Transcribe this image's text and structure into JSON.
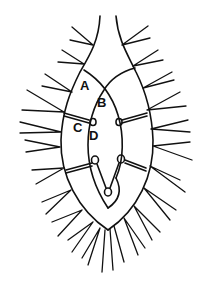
{
  "diagram": {
    "type": "biological-line-drawing",
    "stroke_color": "#111111",
    "background_color": "#ffffff",
    "labels": [
      {
        "id": "A",
        "text": "A",
        "x": 80,
        "y": 90
      },
      {
        "id": "B",
        "text": "B",
        "x": 97,
        "y": 107
      },
      {
        "id": "C",
        "text": "C",
        "x": 73,
        "y": 132
      },
      {
        "id": "D",
        "text": "D",
        "x": 89,
        "y": 140
      }
    ]
  }
}
